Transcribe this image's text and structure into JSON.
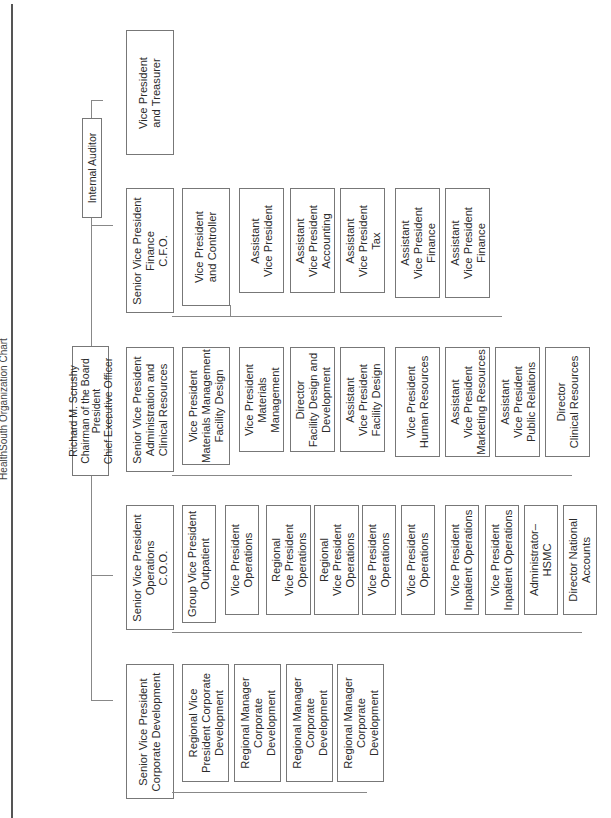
{
  "title": "HealthSouth Organization Chart",
  "ceo": "Richard M. Scrushy\nChairman of the Board\nPresident\nChief Executive Officer",
  "auditor": "Internal Auditor",
  "divisions": {
    "corp_dev": {
      "head": "Senior Vice President\nCorporate Development",
      "reports": [
        "Regional Vice\nPresident Corporate\nDevelopment",
        "Regional Manager\nCorporate\nDevelopment",
        "Regional Manager\nCorporate\nDevelopment",
        "Regional Manager\nCorporate\nDevelopment"
      ]
    },
    "operations": {
      "head": "Senior Vice President\nOperations\nC.O.O.",
      "group_vp": "Group Vice President\nOutpatient",
      "outpatient_reports": [
        "Vice President\nOperations",
        "Regional\nVice President\nOperations",
        "Regional\nVice President\nOperations",
        "Vice President\nOperations",
        "Vice President\nOperations"
      ],
      "reports": [
        "Vice President\nInpatient Operations",
        "Vice President\nInpatient Operations",
        "Administrator–\nHSMC",
        "Director National\nAccounts"
      ]
    },
    "administration": {
      "head": "Senior Vice President\nAdministration and\nClinical Resources",
      "materials_vp": "Vice President\nMaterials Management\nFacility Design",
      "materials_reports": [
        "Vice President\nMaterials\nManagement",
        "Director\nFacility Design and\nDevelopment",
        "Assistant\nVice President\nFacility Design"
      ],
      "reports": [
        "Vice President\nHuman Resources",
        "Assistant\nVice President\nMarketing Resources",
        "Assistant\nVice President\nPublic Relations",
        "Director\nClinical Resources"
      ]
    },
    "finance": {
      "head": "Senior Vice President\nFinance\nC.F.O.",
      "controller": "Vice President\nand Controller",
      "controller_reports": [
        "Assistant\nVice President",
        "Assistant\nVice President\nAccounting",
        "Assistant\nVice President\nTax"
      ],
      "reports": [
        "Assistant\nVice President\nFinance",
        "Assistant\nVice President\nFinance"
      ]
    },
    "treasurer": "Vice President\nand Treasurer"
  }
}
